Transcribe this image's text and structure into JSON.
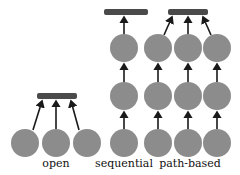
{
  "colors": {
    "node": "#8c8c8c",
    "bar": "#4a4a4a",
    "arrow": "#1a1a1a"
  },
  "groups": [
    {
      "label": "open",
      "label_x": 56
    },
    {
      "label": "sequential",
      "label_x": 124
    },
    {
      "label": "path-based",
      "label_x": 190
    }
  ]
}
